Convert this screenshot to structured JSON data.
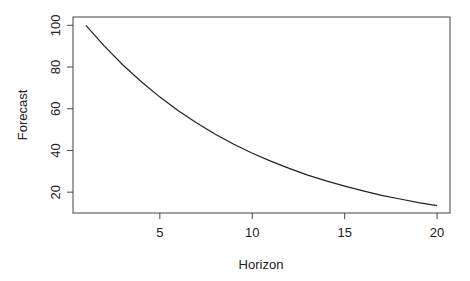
{
  "chart_data": {
    "type": "line",
    "title": "",
    "xlabel": "Horizon",
    "ylabel": "Forecast",
    "xlim": [
      0.3,
      20.7
    ],
    "ylim": [
      10,
      104
    ],
    "x_ticks": [
      5,
      10,
      15,
      20
    ],
    "y_ticks": [
      20,
      40,
      60,
      80,
      100
    ],
    "grid": false,
    "legend": null,
    "series": [
      {
        "name": "Forecast",
        "x": [
          1,
          2,
          3,
          4,
          5,
          6,
          7,
          8,
          9,
          10,
          11,
          12,
          13,
          14,
          15,
          16,
          17,
          18,
          19,
          20
        ],
        "values": [
          100.0,
          90.0,
          81.0,
          72.9,
          65.6,
          59.0,
          53.1,
          47.8,
          43.0,
          38.7,
          34.9,
          31.4,
          28.2,
          25.4,
          22.9,
          20.6,
          18.5,
          16.7,
          15.0,
          13.5
        ]
      }
    ]
  }
}
